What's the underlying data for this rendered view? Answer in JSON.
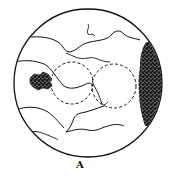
{
  "figure": {
    "label": "A",
    "colors": {
      "stroke": "#111111",
      "fill_dark": "#1a1a1a",
      "background": "#ffffff"
    },
    "elements": [
      {
        "name": "outer-circle",
        "cx": 88,
        "cy": 83,
        "r": 74
      },
      {
        "name": "dashed-circle-left",
        "cx": 72,
        "cy": 83,
        "r": 21
      },
      {
        "name": "dashed-circle-right",
        "cx": 114,
        "cy": 86,
        "r": 22
      },
      {
        "name": "dark-patch-left"
      },
      {
        "name": "stippled-crescent-right"
      }
    ]
  }
}
